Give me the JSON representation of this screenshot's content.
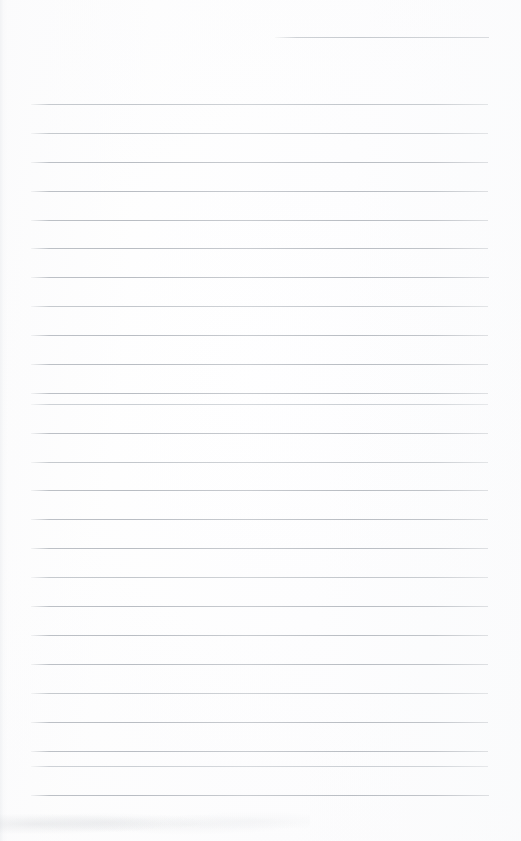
{
  "document": {
    "kind": "scanned-lined-notepad-page",
    "title": "Blank Lined Page",
    "content_text": "",
    "page_width": 521,
    "page_height": 841,
    "background_color": "#fdfdfd",
    "line_color": "#b9bdc3",
    "notes_text": ""
  },
  "ruling": {
    "line_count_total": 26,
    "full_line_count": 25,
    "partial_line_count": 1,
    "line_spacing_px": 28.9,
    "line_thickness_px": 1,
    "margin_left_px": 30,
    "margin_right_px": 488,
    "first_full_line_y": 104,
    "last_full_line_y": 795,
    "lines": [
      {
        "index": 0,
        "y": 37,
        "x1": 275,
        "x2": 489,
        "weight": "partial"
      },
      {
        "index": 1,
        "y": 104,
        "x1": 31,
        "x2": 488,
        "weight": "soft"
      },
      {
        "index": 2,
        "y": 133,
        "x1": 31,
        "x2": 488,
        "weight": "soft"
      },
      {
        "index": 3,
        "y": 162,
        "x1": 31,
        "x2": 488,
        "weight": "normal"
      },
      {
        "index": 4,
        "y": 191,
        "x1": 31,
        "x2": 488,
        "weight": "normal"
      },
      {
        "index": 5,
        "y": 220,
        "x1": 31,
        "x2": 488,
        "weight": "normal"
      },
      {
        "index": 6,
        "y": 248,
        "x1": 31,
        "x2": 488,
        "weight": "normal"
      },
      {
        "index": 7,
        "y": 277,
        "x1": 31,
        "x2": 489,
        "weight": "normal"
      },
      {
        "index": 8,
        "y": 306,
        "x1": 31,
        "x2": 488,
        "weight": "soft"
      },
      {
        "index": 9,
        "y": 335,
        "x1": 31,
        "x2": 488,
        "weight": "normal"
      },
      {
        "index": 10,
        "y": 364,
        "x1": 31,
        "x2": 488,
        "weight": "normal"
      },
      {
        "index": 11,
        "y": 393,
        "x1": 31,
        "x2": 488,
        "weight": "normal"
      },
      {
        "index": 12,
        "y": 404,
        "x1": 31,
        "x2": 488,
        "weight": "softer"
      },
      {
        "index": 13,
        "y": 433,
        "x1": 31,
        "x2": 488,
        "weight": "normal"
      },
      {
        "index": 14,
        "y": 462,
        "x1": 31,
        "x2": 488,
        "weight": "soft"
      },
      {
        "index": 15,
        "y": 490,
        "x1": 31,
        "x2": 488,
        "weight": "normal"
      },
      {
        "index": 16,
        "y": 519,
        "x1": 31,
        "x2": 488,
        "weight": "normal"
      },
      {
        "index": 17,
        "y": 548,
        "x1": 31,
        "x2": 488,
        "weight": "normal"
      },
      {
        "index": 18,
        "y": 577,
        "x1": 31,
        "x2": 488,
        "weight": "soft"
      },
      {
        "index": 19,
        "y": 606,
        "x1": 31,
        "x2": 488,
        "weight": "normal"
      },
      {
        "index": 20,
        "y": 635,
        "x1": 31,
        "x2": 488,
        "weight": "normal"
      },
      {
        "index": 21,
        "y": 664,
        "x1": 31,
        "x2": 488,
        "weight": "normal"
      },
      {
        "index": 22,
        "y": 693,
        "x1": 31,
        "x2": 488,
        "weight": "soft"
      },
      {
        "index": 23,
        "y": 722,
        "x1": 31,
        "x2": 488,
        "weight": "normal"
      },
      {
        "index": 24,
        "y": 751,
        "x1": 31,
        "x2": 488,
        "weight": "normal"
      },
      {
        "index": 25,
        "y": 766,
        "x1": 31,
        "x2": 488,
        "weight": "softer"
      },
      {
        "index": 26,
        "y": 795,
        "x1": 31,
        "x2": 489,
        "weight": "normal"
      }
    ]
  }
}
